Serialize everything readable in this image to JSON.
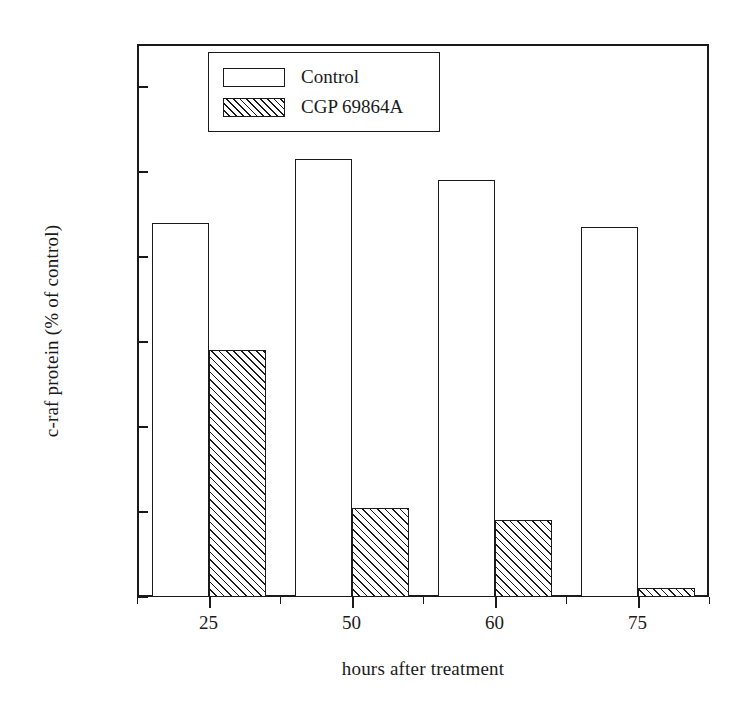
{
  "chart_data": {
    "type": "bar",
    "title": "",
    "xlabel": "hours after treatment",
    "ylabel": "c-raf protein (% of control)",
    "categories": [
      "25",
      "50",
      "60",
      "75"
    ],
    "series": [
      {
        "name": "Control",
        "values": [
          88,
          103,
          98,
          87
        ],
        "fill": "open"
      },
      {
        "name": "CGP 69864A",
        "values": [
          58,
          21,
          18,
          2
        ],
        "fill": "hatched"
      }
    ],
    "ylim": [
      0,
      130
    ],
    "yticks": [
      0,
      20,
      40,
      60,
      80,
      100,
      120
    ],
    "ytick_labels": [
      "0",
      "20",
      "40",
      "60",
      "80",
      "100",
      "120"
    ],
    "grid": false,
    "legend_position": "top-left-inside",
    "colors": {
      "axis": "#1a1a1a",
      "background": "#ffffff",
      "bar_outline": "#1a1a1a",
      "hatch": "#1a1a1a"
    }
  },
  "legend": {
    "items": [
      {
        "label": "Control",
        "fill": "open"
      },
      {
        "label": "CGP 69864A",
        "fill": "hatched"
      }
    ]
  }
}
